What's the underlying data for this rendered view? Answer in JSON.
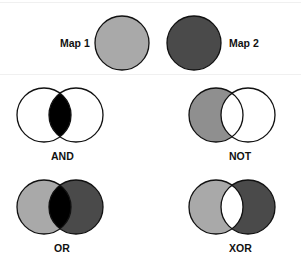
{
  "legend": {
    "map1": {
      "label": "Map 1",
      "fill": "#a9a9a9"
    },
    "map2": {
      "label": "Map 2",
      "fill": "#4a4a4a"
    }
  },
  "operations": [
    {
      "label": "AND",
      "description": "intersection only"
    },
    {
      "label": "NOT",
      "description": "Map 1 minus Map 2"
    },
    {
      "label": "OR",
      "description": "union of both maps"
    },
    {
      "label": "XOR",
      "description": "union minus intersection"
    }
  ],
  "colors": {
    "map1": "#a9a9a9",
    "map2": "#4a4a4a",
    "overlap": "#000000",
    "outline": "#111111",
    "empty": "#ffffff"
  }
}
